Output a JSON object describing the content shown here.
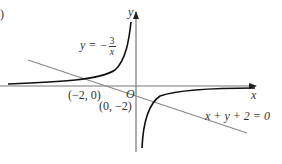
{
  "figure": {
    "panel_label": ")",
    "axes": {
      "x_label": "x",
      "y_label": "y",
      "origin_label": "O",
      "axis_color": "#666666"
    },
    "curve": {
      "equation_prefix": "y = −",
      "numerator": "3",
      "denominator": "x",
      "color": "#111111"
    },
    "line": {
      "equation": "x + y + 2 = 0",
      "color": "#777777"
    },
    "points": [
      {
        "label": "(−2, 0)"
      },
      {
        "label": "(0, −2)"
      }
    ]
  }
}
